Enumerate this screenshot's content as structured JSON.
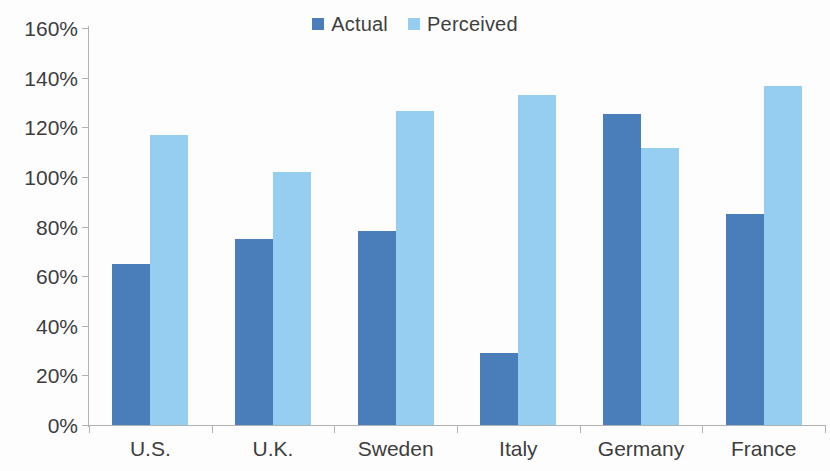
{
  "chart_data": {
    "type": "bar",
    "title": "",
    "subtitle": "",
    "xlabel": "",
    "ylabel": "",
    "categories": [
      "U.S.",
      "U.K.",
      "Sweden",
      "Italy",
      "Germany",
      "France"
    ],
    "series": [
      {
        "name": "Actual",
        "color": "#4a7ebb",
        "values": [
          65,
          75,
          78,
          29,
          125.5,
          85
        ]
      },
      {
        "name": "Perceived",
        "color": "#95cef0",
        "values": [
          117,
          102,
          126.5,
          133,
          111.5,
          136.5
        ]
      }
    ],
    "ylim": [
      0,
      160
    ],
    "ytick_step": 20,
    "ytick_labels": [
      "160%",
      "140%",
      "120%",
      "100%",
      "80%",
      "60%",
      "40%",
      "20%",
      "0%"
    ],
    "ytick_values": [
      160,
      140,
      120,
      100,
      80,
      60,
      40,
      20,
      0
    ],
    "value_suffix": "%",
    "grid": false,
    "legend_position": "top-center",
    "legend": [
      {
        "label": "Actual",
        "color": "#4a7ebb"
      },
      {
        "label": "Perceived",
        "color": "#95cef0"
      }
    ]
  },
  "colors": {
    "series_actual": "#4a7ebb",
    "series_perceived": "#95cef0",
    "axis": "#b2b2b2",
    "text": "#3d3d3d",
    "background": "#fdfdfd"
  }
}
